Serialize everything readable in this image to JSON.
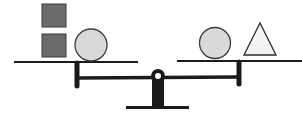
{
  "diagram": {
    "colors": {
      "outline": "#1a1a1a",
      "square_fill": "#6b6b6b",
      "circle_fill": "#d9d9d9",
      "triangle_fill": "#f2f2f2",
      "background": "#ffffff"
    },
    "left_pan": {
      "items": [
        {
          "shape": "square",
          "position": "top"
        },
        {
          "shape": "square",
          "position": "bottom"
        },
        {
          "shape": "circle",
          "position": "bottom-right"
        }
      ]
    },
    "right_pan": {
      "items": [
        {
          "shape": "circle"
        },
        {
          "shape": "triangle"
        }
      ]
    }
  }
}
